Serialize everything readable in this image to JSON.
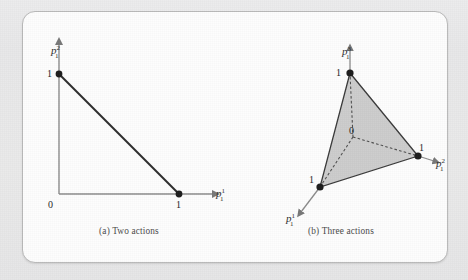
{
  "figure": {
    "background_color": "#e9e9e9",
    "panel_color": "#fdfdfd",
    "border_color": "#b9b9b9",
    "axis_color": "#808080",
    "curve_color": "#2b2b2b",
    "fill_color": "#c9c9c9",
    "dash_color": "#555555"
  },
  "panels": [
    {
      "id": "two-actions",
      "caption": "(a) Two actions",
      "type": "simplex-2d",
      "axes": [
        {
          "name": "vertical",
          "label_base": "p",
          "label_sup": "2",
          "label_sub": "1"
        },
        {
          "name": "horizontal",
          "label_base": "p",
          "label_sup": "1",
          "label_sub": "1"
        }
      ],
      "origin_label": "0",
      "tick_labels": {
        "y_one": "1",
        "x_one": "1"
      },
      "vertices": [
        {
          "name": "e2",
          "label": "1",
          "coords": [
            0,
            1
          ]
        },
        {
          "name": "e1",
          "label": "1",
          "coords": [
            1,
            0
          ]
        }
      ],
      "segment": {
        "from": [
          0,
          1
        ],
        "to": [
          1,
          0
        ]
      }
    },
    {
      "id": "three-actions",
      "caption": "(b) Three actions",
      "type": "simplex-3d",
      "axes": [
        {
          "name": "up",
          "label_base": "p",
          "label_sup": "3",
          "label_sub": "1"
        },
        {
          "name": "right",
          "label_base": "p",
          "label_sup": "2",
          "label_sub": "1"
        },
        {
          "name": "front-left",
          "label_base": "p",
          "label_sup": "1",
          "label_sub": "1"
        }
      ],
      "origin_label": "0",
      "vertices": [
        {
          "name": "e3",
          "label": "1",
          "axis": "up"
        },
        {
          "name": "e2",
          "label": "1",
          "axis": "right"
        },
        {
          "name": "e1",
          "label": "1",
          "axis": "front-left"
        }
      ],
      "shaded_triangle": true,
      "dashed_axes": true
    }
  ]
}
